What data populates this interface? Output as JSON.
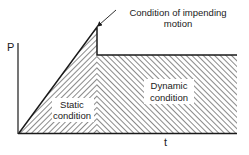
{
  "diagram": {
    "y_axis_label": "P",
    "x_axis_label": "t",
    "annotations": {
      "impending_line1": "Condition of impending",
      "impending_line2": "motion",
      "static_line1": "Static",
      "static_line2": "condition",
      "dynamic_line1": "Dynamic",
      "dynamic_line2": "condition"
    },
    "colors": {
      "ink": "#1a1a1a",
      "hatch": "#3a3a3a",
      "background": "#ffffff"
    }
  }
}
